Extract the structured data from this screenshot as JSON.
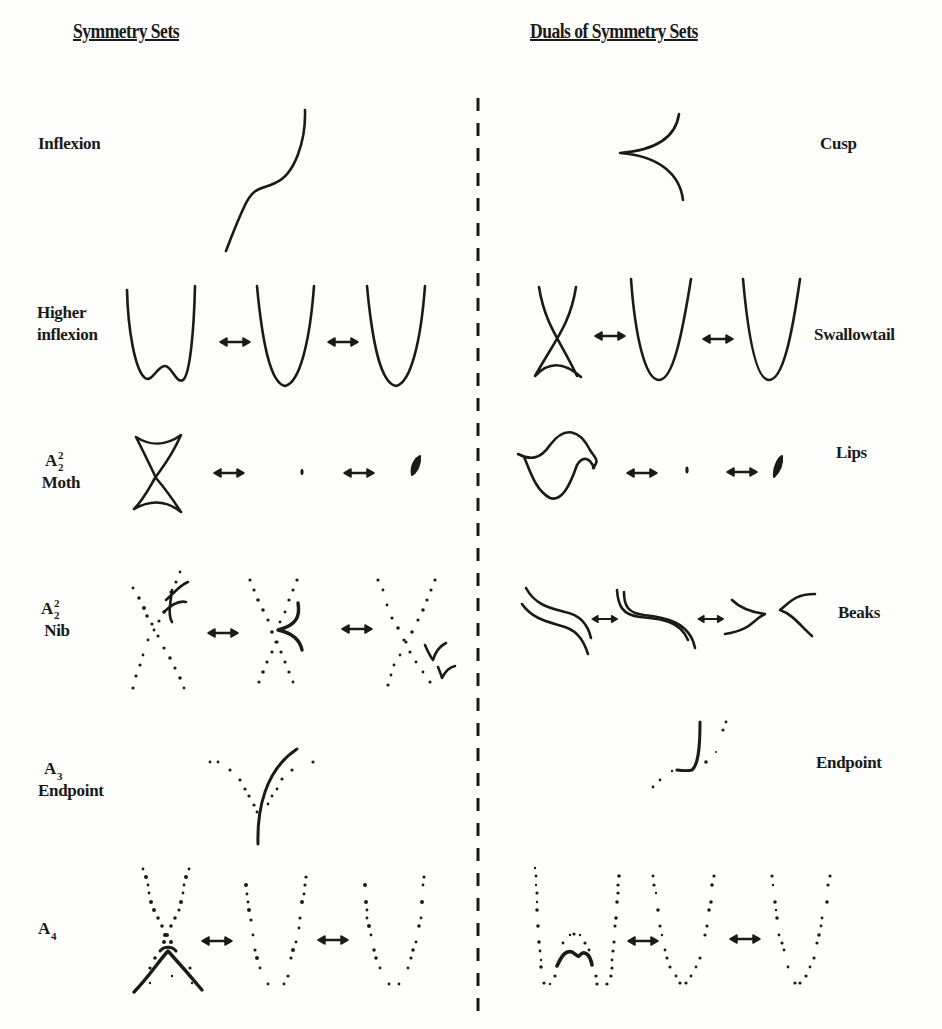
{
  "headers": {
    "left": "Symmetry Sets",
    "right": "Duals of Symmetry Sets"
  },
  "rows": [
    {
      "id": "inflexion",
      "left_label": "Inflexion",
      "right_label": "Cusp"
    },
    {
      "id": "higher-inflexion",
      "left_label_line1": "Higher",
      "left_label_line2": "inflexion",
      "right_label": "Swallowtail"
    },
    {
      "id": "moth",
      "left_symbol": "A",
      "left_symbol_sup": "2",
      "left_symbol_sub": "2",
      "left_label": "Moth",
      "right_label": "Lips"
    },
    {
      "id": "nib",
      "left_symbol": "A",
      "left_symbol_sup": "2",
      "left_symbol_sub": "2",
      "left_label": "Nib",
      "right_label": "Beaks"
    },
    {
      "id": "endpoint",
      "left_symbol": "A",
      "left_symbol_sub": "3",
      "left_label": "Endpoint",
      "right_label": "Endpoint"
    },
    {
      "id": "a4",
      "left_symbol": "A",
      "left_symbol_sub": "4"
    }
  ],
  "transition_symbol": "double-headed-arrow",
  "divider": "dashed-vertical-line"
}
